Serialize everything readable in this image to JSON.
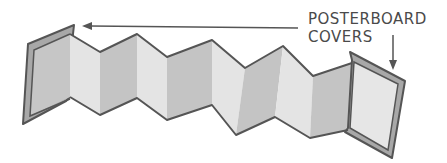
{
  "diagram": {
    "labels": {
      "line1": "POSTERBOARD",
      "line2": "COVERS"
    },
    "colors": {
      "outline": "#555555",
      "cover": "#a8a8a8",
      "panel_light": "#e3e3e3",
      "panel_dark": "#c4c4c4",
      "arrow": "#555555"
    },
    "annotations": [
      {
        "type": "arrow",
        "points_to": "left cover",
        "direction": "left"
      },
      {
        "type": "arrow",
        "points_to": "right cover",
        "direction": "down"
      }
    ]
  }
}
